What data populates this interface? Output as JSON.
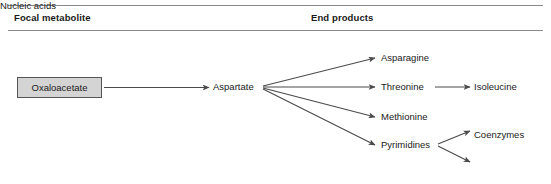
{
  "figure": {
    "type": "metabolic-pathway-diagram",
    "columns": {
      "focal": "Focal metabolite",
      "end": "End products"
    },
    "focal_metabolite": {
      "label": "Oxaloacetate",
      "fill_color": "#d4d4d4",
      "border_color": "#555555"
    },
    "intermediate": {
      "label": "Aspartate"
    },
    "end_products": [
      {
        "label": "Asparagine"
      },
      {
        "label": "Threonine"
      },
      {
        "label": "Methionine"
      },
      {
        "label": "Pyrimidines"
      }
    ],
    "secondary_products": [
      {
        "label": "Isoleucine",
        "from": "Threonine"
      },
      {
        "label": "Coenzymes",
        "from": "Pyrimidines"
      },
      {
        "label": "Nucleic acids",
        "from": "Pyrimidines"
      }
    ],
    "arrow_color": "#4a4a4a",
    "rule_color": "#8a8a8a"
  }
}
